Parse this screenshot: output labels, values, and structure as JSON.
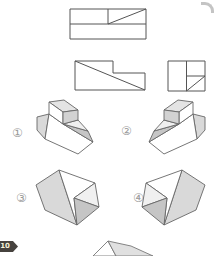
{
  "solids": [
    {
      "label": "①"
    },
    {
      "label": "②"
    },
    {
      "label": "③"
    },
    {
      "label": "④"
    }
  ],
  "badge": {
    "text": "10"
  },
  "figures": {
    "views": [
      "top-view-drawing",
      "front-view-drawing",
      "side-view-drawing"
    ],
    "solids": [
      "wedge-with-block-on-top",
      "wedge-with-block-on-top-mirrored",
      "notched-wedge",
      "notched-wedge-mirrored"
    ],
    "partial": "partial-solid-cut-at-bottom-edge"
  },
  "palette": {
    "view_stroke": "#555555",
    "solid_stroke": "#666666",
    "face_white": "#ffffff",
    "face_light": "#f0f0f0",
    "face_mid": "#d9d9d9",
    "face_dark": "#c5c5c5",
    "box_top": "#e4e4e4",
    "box_side": "#d2d2d2",
    "label_color": "#9a9a9a",
    "badge_bg": "#46423e",
    "badge_text": "#f7f3d9",
    "corner_mark": "#c4c4c4"
  }
}
